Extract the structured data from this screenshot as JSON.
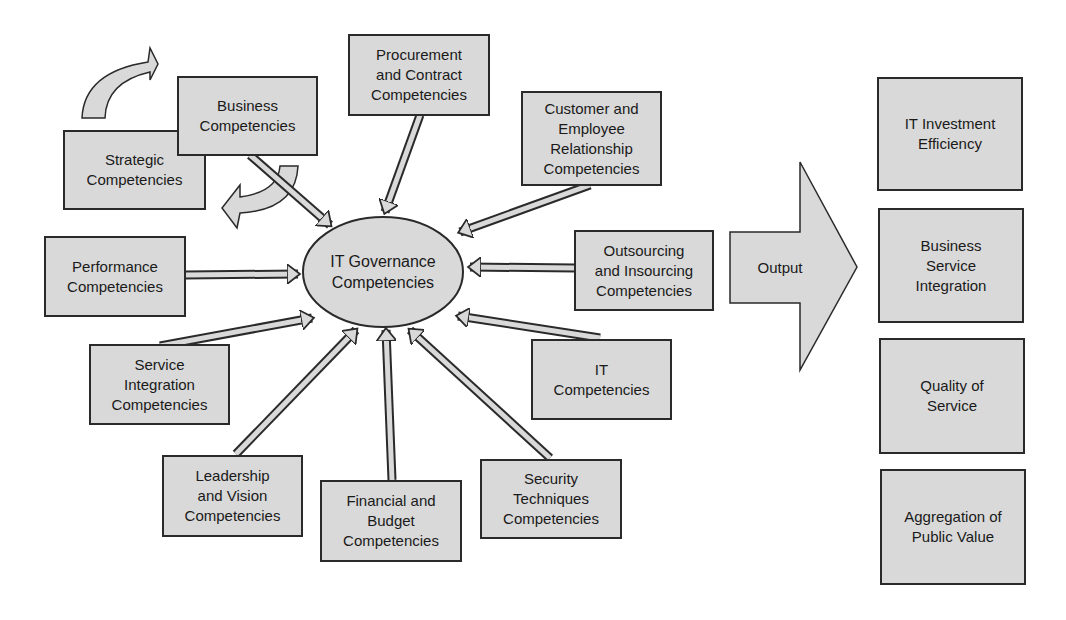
{
  "center": {
    "label": "IT Governance\nCompetencies"
  },
  "inputs": {
    "strategic": "Strategic\nCompetencies",
    "business": "Business\nCompetencies",
    "procurement": "Procurement\nand Contract\nCompetencies",
    "customer": "Customer and\nEmployee\nRelationship\nCompetencies",
    "performance": "Performance\nCompetencies",
    "outsourcing": "Outsourcing\nand Insourcing\nCompetencies",
    "service_integration": "Service\nIntegration\nCompetencies",
    "it": "IT\nCompetencies",
    "leadership": "Leadership\nand Vision\nCompetencies",
    "financial": "Financial and\nBudget\nCompetencies",
    "security": "Security\nTechniques\nCompetencies"
  },
  "output_arrow": {
    "label": "Output"
  },
  "outputs": [
    "IT Investment\nEfficiency",
    "Business\nService\nIntegration",
    "Quality of\nService",
    "Aggregation of\nPublic Value"
  ],
  "colors": {
    "fill": "#d9d9d9",
    "stroke": "#2a2a2a",
    "background": "#ffffff"
  }
}
